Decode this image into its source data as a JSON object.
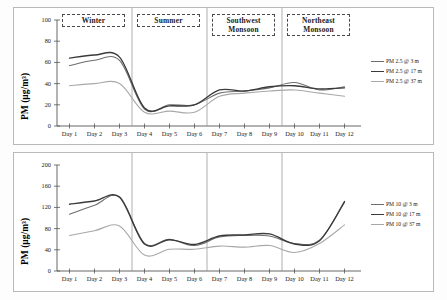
{
  "figure": {
    "background": "#ffffff",
    "frame_color": "#b9b9b9"
  },
  "seasons": [
    {
      "label": "Winter",
      "start_day": 1,
      "end_day": 3
    },
    {
      "label": "Summer",
      "start_day": 4,
      "end_day": 6
    },
    {
      "label": "Southwest Monsoon",
      "start_day": 7,
      "end_day": 9
    },
    {
      "label": "Northeast Monsoon",
      "start_day": 10,
      "end_day": 12
    }
  ],
  "colors": {
    "series_3m": "#6e6e6e",
    "series_17m": "#3a3a3a",
    "series_37m": "#a8a8a8",
    "separator": "#8d8d8d",
    "axis": "#555555"
  },
  "chart_data": [
    {
      "type": "line",
      "id": "pm25",
      "title": "",
      "xlabel": "",
      "ylabel": "PM (µg/m³)",
      "ylim": [
        0,
        100
      ],
      "yticks": [
        0,
        20,
        40,
        60,
        80,
        100
      ],
      "ytick_labels": [
        "0",
        "20",
        "40",
        "60",
        "80",
        "100"
      ],
      "x": [
        1,
        2,
        3,
        4,
        5,
        6,
        7,
        8,
        9,
        10,
        11,
        12
      ],
      "categories": [
        "Day 1",
        "Day 2",
        "Day 3",
        "Day 4",
        "Day 5",
        "Day 6",
        "Day 7",
        "Day 8",
        "Day 9",
        "Day 10",
        "Day 11",
        "Day 12"
      ],
      "grid": false,
      "legend_position": "right",
      "series": [
        {
          "name": "PM 2.5 @ 3 m",
          "color": "#6e6e6e",
          "values": [
            57,
            62,
            62,
            16,
            20,
            20,
            31,
            33,
            36,
            41,
            34,
            37
          ]
        },
        {
          "name": "PM 2.5 @ 17 m",
          "color": "#3a3a3a",
          "values": [
            64,
            67,
            65,
            17,
            19,
            20,
            34,
            33,
            37,
            38,
            35,
            36
          ]
        },
        {
          "name": "PM 2.5 @ 37 m",
          "color": "#a8a8a8",
          "values": [
            38,
            40,
            40,
            13,
            14,
            13,
            28,
            31,
            33,
            34,
            31,
            28
          ]
        }
      ]
    },
    {
      "type": "line",
      "id": "pm10",
      "title": "",
      "xlabel": "",
      "ylabel": "PM (µg/m³)",
      "ylim": [
        0,
        200
      ],
      "yticks": [
        0,
        40,
        80,
        120,
        160,
        200
      ],
      "ytick_labels": [
        "0",
        "40",
        "80",
        "120",
        "160",
        "200"
      ],
      "x": [
        1,
        2,
        3,
        4,
        5,
        6,
        7,
        8,
        9,
        10,
        11,
        12
      ],
      "categories": [
        "Day 1",
        "Day 2",
        "Day 3",
        "Day 4",
        "Day 5",
        "Day 6",
        "Day 7",
        "Day 8",
        "Day 9",
        "Day 10",
        "Day 11",
        "Day 12"
      ],
      "grid": false,
      "legend_position": "right",
      "series": [
        {
          "name": "PM 10 @ 3 m",
          "color": "#6e6e6e",
          "values": [
            107,
            124,
            140,
            52,
            60,
            48,
            64,
            67,
            66,
            52,
            58,
            130
          ]
        },
        {
          "name": "PM 10 @ 17 m",
          "color": "#3a3a3a",
          "values": [
            126,
            132,
            139,
            51,
            59,
            50,
            66,
            68,
            70,
            51,
            57,
            131
          ]
        },
        {
          "name": "PM 10 @ 37 m",
          "color": "#a8a8a8",
          "values": [
            67,
            76,
            85,
            30,
            41,
            41,
            47,
            45,
            48,
            35,
            52,
            87
          ]
        }
      ]
    }
  ]
}
